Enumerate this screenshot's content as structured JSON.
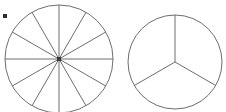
{
  "figure": {
    "canvas": {
      "width": 226,
      "height": 112,
      "background": "#ffffff"
    },
    "stroke_color": "#6e6e70",
    "stroke_width": 1,
    "fill_color": "#ffffff",
    "marks": [
      {
        "name": "corner-dot",
        "shape": "square",
        "x": 3,
        "y": 14,
        "size": 4,
        "color": "#2e2e30"
      },
      {
        "name": "left-circle-center-hub",
        "shape": "square",
        "x": 57,
        "y": 57,
        "size": 4,
        "color": "#3a3a3c"
      }
    ],
    "circles": [
      {
        "name": "twelfths-circle",
        "label": "circle divided into twelfths",
        "center_x": 59,
        "center_y": 59,
        "radius": 54,
        "segments": 12,
        "fraction_each": "1/12",
        "start_angle_deg": -90,
        "clipped_edges": "top,bottom"
      },
      {
        "name": "thirds-circle",
        "label": "circle divided into thirds",
        "center_x": 175,
        "center_y": 62,
        "radius": 47,
        "segments": 3,
        "fraction_each": "1/3",
        "start_angle_deg": -90,
        "clipped_edges": "none"
      }
    ]
  }
}
